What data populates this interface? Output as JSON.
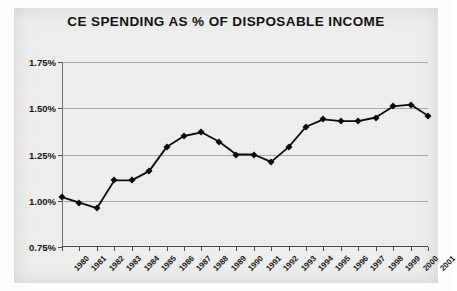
{
  "chart_data": {
    "type": "line",
    "title": "CE SPENDING AS % OF DISPOSABLE INCOME",
    "xlabel": "",
    "ylabel": "",
    "categories": [
      "1980",
      "1981",
      "1982",
      "1983",
      "1984",
      "1985",
      "1986",
      "1987",
      "1988",
      "1989",
      "1990",
      "1991",
      "1992",
      "1993",
      "1994",
      "1995",
      "1996",
      "1997",
      "1998",
      "1999",
      "2000",
      "2001"
    ],
    "values": [
      1.02,
      0.99,
      0.96,
      1.11,
      1.11,
      1.16,
      1.29,
      1.35,
      1.37,
      1.32,
      1.25,
      1.25,
      1.21,
      1.29,
      1.4,
      1.44,
      1.43,
      1.43,
      1.45,
      1.51,
      1.52,
      1.46
    ],
    "ylim": [
      0.75,
      1.75
    ],
    "ytick_labels": [
      "0.75%",
      "1.00%",
      "1.25%",
      "1.50%",
      "1.75%"
    ],
    "ytick_values": [
      0.75,
      1.0,
      1.25,
      1.5,
      1.75
    ],
    "grid": "horizontal",
    "legend": "none",
    "marker": "diamond",
    "line_color": "#0c0c0c",
    "marker_color": "#0c0c0c",
    "background_color": "#efefee",
    "grid_color": "#8d8d8d"
  },
  "ylabels": {
    "t0": "0.75%",
    "t1": "1.00%",
    "t2": "1.25%",
    "t3": "1.50%",
    "t4": "1.75%"
  }
}
